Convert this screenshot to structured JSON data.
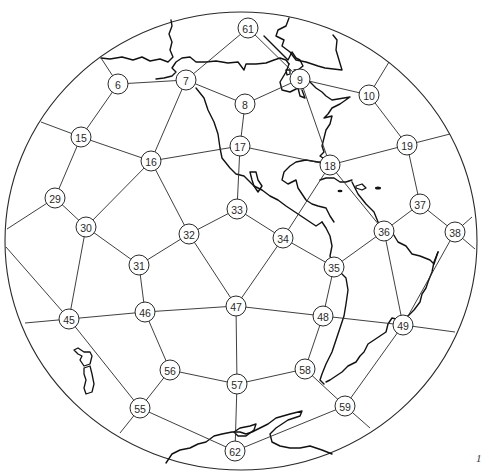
{
  "figure": {
    "type": "geodesic-grid-projection",
    "mark": "1",
    "colors": {
      "line": "#2a2a2a",
      "coast": "#111111",
      "background": "#ffffff"
    }
  },
  "globe": {
    "cx": 241,
    "cy": 241,
    "rx": 236,
    "ry": 229
  },
  "nodes": [
    {
      "id": "61",
      "x": 248,
      "y": 28
    },
    {
      "id": "6",
      "x": 118,
      "y": 84
    },
    {
      "id": "7",
      "x": 186,
      "y": 80
    },
    {
      "id": "8",
      "x": 245,
      "y": 104
    },
    {
      "id": "9",
      "x": 300,
      "y": 79
    },
    {
      "id": "10",
      "x": 369,
      "y": 95
    },
    {
      "id": "15",
      "x": 81,
      "y": 137
    },
    {
      "id": "16",
      "x": 151,
      "y": 161
    },
    {
      "id": "17",
      "x": 240,
      "y": 146
    },
    {
      "id": "18",
      "x": 330,
      "y": 165
    },
    {
      "id": "19",
      "x": 407,
      "y": 145
    },
    {
      "id": "29",
      "x": 55,
      "y": 198
    },
    {
      "id": "30",
      "x": 86,
      "y": 227
    },
    {
      "id": "31",
      "x": 139,
      "y": 265
    },
    {
      "id": "32",
      "x": 189,
      "y": 234
    },
    {
      "id": "33",
      "x": 237,
      "y": 209
    },
    {
      "id": "34",
      "x": 283,
      "y": 238
    },
    {
      "id": "35",
      "x": 334,
      "y": 267
    },
    {
      "id": "36",
      "x": 384,
      "y": 231
    },
    {
      "id": "37",
      "x": 420,
      "y": 204
    },
    {
      "id": "38",
      "x": 455,
      "y": 232
    },
    {
      "id": "45",
      "x": 69,
      "y": 319
    },
    {
      "id": "46",
      "x": 145,
      "y": 312
    },
    {
      "id": "47",
      "x": 236,
      "y": 306
    },
    {
      "id": "48",
      "x": 323,
      "y": 316
    },
    {
      "id": "49",
      "x": 403,
      "y": 325
    },
    {
      "id": "56",
      "x": 170,
      "y": 370
    },
    {
      "id": "57",
      "x": 237,
      "y": 384
    },
    {
      "id": "58",
      "x": 305,
      "y": 369
    },
    {
      "id": "59",
      "x": 345,
      "y": 406
    },
    {
      "id": "55",
      "x": 140,
      "y": 408
    },
    {
      "id": "62",
      "x": 235,
      "y": 451
    }
  ],
  "edges": [
    [
      "6",
      "7"
    ],
    [
      "6",
      "15"
    ],
    [
      "7",
      "61"
    ],
    [
      "7",
      "8"
    ],
    [
      "7",
      "16"
    ],
    [
      "8",
      "9"
    ],
    [
      "8",
      "17"
    ],
    [
      "9",
      "10"
    ],
    [
      "9",
      "18"
    ],
    [
      "10",
      "19"
    ],
    [
      "15",
      "16"
    ],
    [
      "15",
      "29"
    ],
    [
      "16",
      "17"
    ],
    [
      "16",
      "30"
    ],
    [
      "16",
      "32"
    ],
    [
      "17",
      "18"
    ],
    [
      "17",
      "33"
    ],
    [
      "18",
      "19"
    ],
    [
      "18",
      "34"
    ],
    [
      "18",
      "36"
    ],
    [
      "19",
      "37"
    ],
    [
      "29",
      "30"
    ],
    [
      "30",
      "31"
    ],
    [
      "30",
      "45"
    ],
    [
      "31",
      "32"
    ],
    [
      "31",
      "46"
    ],
    [
      "32",
      "33"
    ],
    [
      "32",
      "47"
    ],
    [
      "33",
      "34"
    ],
    [
      "34",
      "35"
    ],
    [
      "34",
      "47"
    ],
    [
      "35",
      "36"
    ],
    [
      "35",
      "48"
    ],
    [
      "36",
      "37"
    ],
    [
      "36",
      "49"
    ],
    [
      "37",
      "38"
    ],
    [
      "38",
      "49"
    ],
    [
      "45",
      "46"
    ],
    [
      "45",
      "55"
    ],
    [
      "46",
      "47"
    ],
    [
      "46",
      "56"
    ],
    [
      "47",
      "48"
    ],
    [
      "47",
      "57"
    ],
    [
      "48",
      "49"
    ],
    [
      "48",
      "58"
    ],
    [
      "49",
      "59"
    ],
    [
      "56",
      "57"
    ],
    [
      "56",
      "55"
    ],
    [
      "57",
      "58"
    ],
    [
      "57",
      "62"
    ],
    [
      "58",
      "59"
    ],
    [
      "55",
      "62"
    ],
    [
      "59",
      "62"
    ],
    [
      "61",
      "9"
    ]
  ],
  "boundary_edges": [
    {
      "from": "6",
      "x": 101,
      "y": 58
    },
    {
      "from": "15",
      "x": 41,
      "y": 122
    },
    {
      "from": "29",
      "x": 7,
      "y": 229
    },
    {
      "from": "45",
      "x": 6,
      "y": 247
    },
    {
      "from": "45",
      "x": 25,
      "y": 323
    },
    {
      "from": "55",
      "x": 120,
      "y": 433
    },
    {
      "from": "59",
      "x": 370,
      "y": 428
    },
    {
      "from": "49",
      "x": 455,
      "y": 332
    },
    {
      "from": "38",
      "x": 472,
      "y": 217
    },
    {
      "from": "38",
      "x": 475,
      "y": 249
    },
    {
      "from": "19",
      "x": 450,
      "y": 134
    },
    {
      "from": "10",
      "x": 389,
      "y": 62
    }
  ]
}
